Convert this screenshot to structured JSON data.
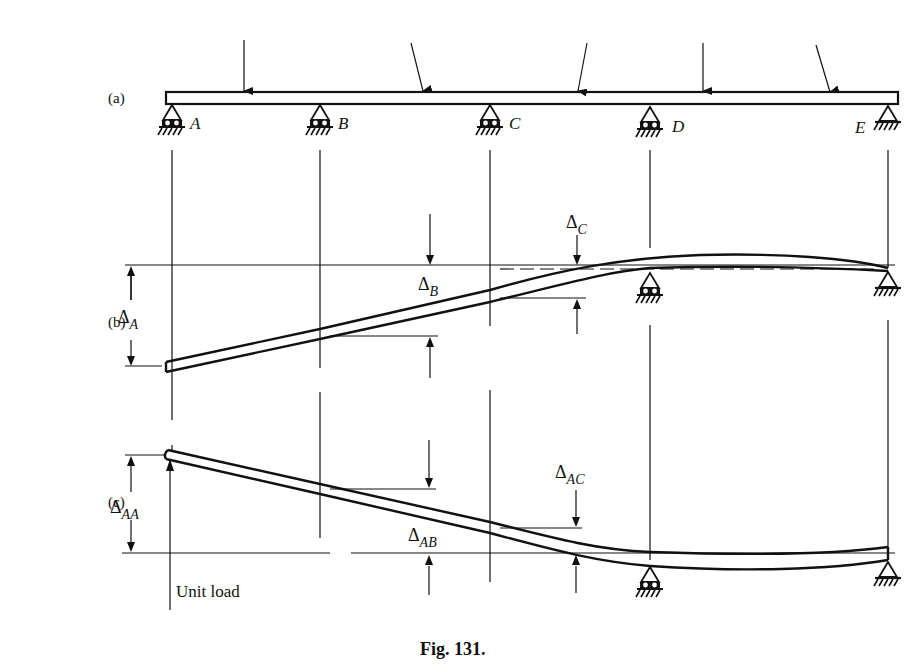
{
  "figure": {
    "caption": "Fig. 131.",
    "panels": [
      {
        "id": "a",
        "label": "(a)",
        "description": "Continuous beam on supports A–E under applied loads"
      },
      {
        "id": "b",
        "label": "(b)",
        "description": "Beam deflected with supports A, B, C removed"
      },
      {
        "id": "c",
        "label": "(c)",
        "description": "Beam deflected by unit load at A"
      }
    ],
    "supports": [
      {
        "name": "A",
        "x": 172,
        "type": "roller"
      },
      {
        "name": "B",
        "x": 320,
        "type": "roller"
      },
      {
        "name": "C",
        "x": 490,
        "type": "roller"
      },
      {
        "name": "D",
        "x": 650,
        "type": "roller"
      },
      {
        "name": "E",
        "x": 888,
        "type": "pin"
      }
    ],
    "labels": {
      "a": {
        "A": "A",
        "B": "B",
        "C": "C",
        "D": "D",
        "E": "E"
      },
      "b": {
        "delta": "Δ",
        "dA_sub": "A",
        "dB_sub": "B",
        "dC_sub": "C"
      },
      "c": {
        "delta": "Δ",
        "dAA_sub": "AA",
        "dAB_sub": "AB",
        "dAC_sub": "AC",
        "unit_load": "Unit load"
      }
    },
    "loads": [
      {
        "x": 244,
        "direction": "vertical"
      },
      {
        "x": 423,
        "direction": "inclined"
      },
      {
        "x": 577,
        "direction": "inclined"
      },
      {
        "x": 703,
        "direction": "vertical"
      },
      {
        "x": 830,
        "direction": "inclined"
      }
    ]
  }
}
